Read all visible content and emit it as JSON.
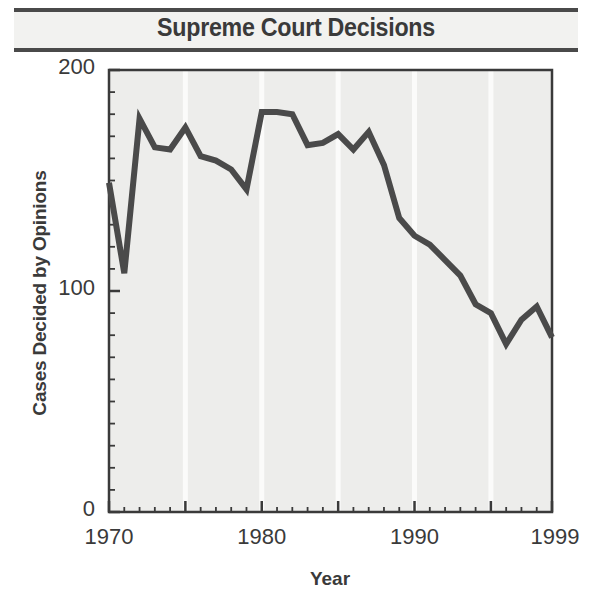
{
  "title": "Supreme Court Decisions",
  "axes": {
    "x_title": "Year",
    "y_title": "Cases Decided by Opinions",
    "y_ticks": [
      "0",
      "100",
      "200"
    ],
    "x_ticks": [
      "1970",
      "1980",
      "1990",
      "1999"
    ]
  },
  "colors": {
    "line": "#4a4a4a",
    "plot_background": "#ededeb",
    "gridline": "#fbfbfa",
    "frame": "#3a3a3a",
    "text": "#3a3a3a",
    "banner": "#f2f2f0",
    "rule": "#4a4a4a"
  },
  "chart_data": {
    "type": "line",
    "title": "Supreme Court Decisions",
    "xlabel": "Year",
    "ylabel": "Cases Decided by Opinions",
    "xlim": [
      1970,
      1999
    ],
    "ylim": [
      0,
      200
    ],
    "x_major_ticks": [
      1970,
      1980,
      1990,
      1999
    ],
    "x_minor_tick_step": 1,
    "y_major_ticks": [
      0,
      100,
      200
    ],
    "y_minor_tick_step": 10,
    "grid": "vertical gridlines every 5 years",
    "legend": "none",
    "x": [
      1970,
      1971,
      1972,
      1973,
      1974,
      1975,
      1976,
      1977,
      1978,
      1979,
      1980,
      1981,
      1982,
      1983,
      1984,
      1985,
      1986,
      1987,
      1988,
      1989,
      1990,
      1991,
      1992,
      1993,
      1994,
      1995,
      1996,
      1997,
      1998,
      1999
    ],
    "values": [
      149,
      108,
      178,
      165,
      164,
      174,
      161,
      159,
      155,
      146,
      181,
      181,
      180,
      166,
      167,
      171,
      164,
      172,
      157,
      133,
      125,
      121,
      114,
      107,
      94,
      90,
      76,
      87,
      93,
      79
    ],
    "series": [
      {
        "name": "Cases decided by opinions",
        "values": [
          149,
          108,
          178,
          165,
          164,
          174,
          161,
          159,
          155,
          146,
          181,
          181,
          180,
          166,
          167,
          171,
          164,
          172,
          157,
          133,
          125,
          121,
          114,
          107,
          94,
          90,
          76,
          87,
          93,
          79
        ]
      }
    ]
  }
}
